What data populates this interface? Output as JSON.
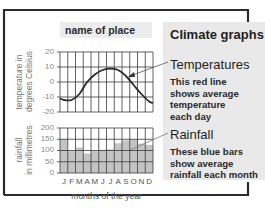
{
  "place_label": "name of place",
  "panel": {
    "title": "Climate graphs",
    "temperatures": {
      "heading": "Temperatures",
      "lines": [
        "This red line",
        "shows average",
        "temperature",
        "each day"
      ]
    },
    "rainfall": {
      "heading": "Rainfall",
      "lines": [
        "These blue bars",
        "show average",
        "rainfall each month"
      ]
    }
  },
  "axes": {
    "temp_ylabel_line1": "temperature in",
    "temp_ylabel_line2": "degrees Celsius",
    "rain_ylabel_line1": "rainfall",
    "rain_ylabel_line2": "in millimetres",
    "temp_ticks": [
      "20",
      "10",
      "0",
      "-10",
      "-20"
    ],
    "rain_ticks": [
      "200",
      "150",
      "100",
      "50",
      "0"
    ],
    "months": [
      "J",
      "F",
      "M",
      "A",
      "M",
      "J",
      "J",
      "A",
      "S",
      "O",
      "N",
      "D"
    ],
    "xlabel": "months of the year"
  },
  "colors": {
    "frame": "#2b2b2b",
    "panel_bg": "#e9e9e9",
    "grid": "#3a3a3a",
    "bar_fill": "#c4c4c4",
    "temp_line": "#2b2b2b"
  },
  "chart_data": [
    {
      "type": "line",
      "title": "Temperatures",
      "xlabel": "months of the year",
      "ylabel": "temperature in degrees Celsius",
      "categories": [
        "J",
        "F",
        "M",
        "A",
        "M",
        "J",
        "J",
        "A",
        "S",
        "O",
        "N",
        "D"
      ],
      "values": [
        -12,
        -12,
        -8,
        0,
        5,
        8,
        9,
        8,
        4,
        -2,
        -8,
        -13
      ],
      "ylim": [
        -20,
        20
      ],
      "yticks": [
        20,
        10,
        0,
        -10,
        -20
      ],
      "grid": true
    },
    {
      "type": "bar",
      "title": "Rainfall",
      "xlabel": "months of the year",
      "ylabel": "rainfall in millimetres",
      "categories": [
        "J",
        "F",
        "M",
        "A",
        "M",
        "J",
        "J",
        "A",
        "S",
        "O",
        "N",
        "D"
      ],
      "values": [
        150,
        97,
        113,
        87,
        97,
        103,
        105,
        132,
        145,
        150,
        130,
        125
      ],
      "ylim": [
        0,
        200
      ],
      "yticks": [
        200,
        150,
        100,
        50,
        0
      ],
      "grid": true
    }
  ]
}
